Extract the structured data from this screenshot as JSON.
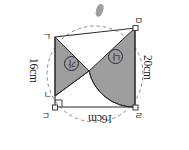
{
  "figure": {
    "kind": "geometry-diagram",
    "orientation_degrees": 180,
    "description_title": "Quadrilateral inscribed in dashed circle with two shaded regions",
    "colors": {
      "shade_fill": "#9e9e9e",
      "outline": "#2a2a2a",
      "dashed_guide": "#7a7a7a",
      "background": "#ffffff",
      "text": "#1b1b1b"
    },
    "dimensions": {
      "top": "16cm",
      "right": "16cm",
      "left": "20cm"
    },
    "vertices": {
      "top_left": "ㄹ",
      "top_right": "ㄷ",
      "bottom_right": "ㄴ",
      "bottom_left": "ㅁ",
      "inner_right": "ㄱ"
    },
    "regions": {
      "left_tag": "나",
      "right_tag": "가"
    },
    "markers": {
      "right_angle": "right-angle-square",
      "vertex_dot": "open-square-node"
    }
  }
}
